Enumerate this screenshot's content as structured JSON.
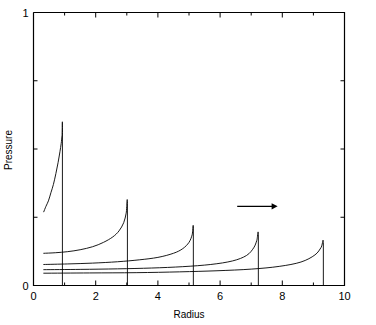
{
  "figure": {
    "background_color": "#ffffff",
    "line_color": "#000000"
  },
  "chart_data": {
    "type": "line",
    "title": "",
    "subtitle": "",
    "xlabel": "Radius",
    "ylabel": "Pressure",
    "xlim": [
      0,
      10
    ],
    "ylim": [
      0,
      1
    ],
    "grid": false,
    "legend": null,
    "x_ticks_major": [
      0,
      2,
      4,
      6,
      8,
      10
    ],
    "x_ticklabels": [
      "0",
      "2",
      "4",
      "6",
      "8",
      "10"
    ],
    "x_ticks_minor": [
      1,
      3,
      5,
      7,
      9
    ],
    "y_ticks_major": [
      0,
      1
    ],
    "y_ticklabels": [
      "0",
      "1"
    ],
    "y_ticks_minor": [
      0.25,
      0.5,
      0.75
    ],
    "series": [
      {
        "name": "profile-1",
        "shock_radius": 0.93,
        "peak_pressure": 0.56,
        "tail_start_x": 0.33,
        "tail_start_y": 0.27,
        "post_shock_y": 0.0,
        "x": [
          0.33,
          0.4,
          0.48,
          0.56,
          0.64,
          0.72,
          0.79,
          0.85,
          0.89,
          0.92,
          0.93,
          0.93
        ],
        "y": [
          0.27,
          0.29,
          0.31,
          0.34,
          0.37,
          0.41,
          0.45,
          0.49,
          0.52,
          0.55,
          0.56,
          0.0
        ]
      },
      {
        "name": "profile-2",
        "shock_radius": 3.02,
        "peak_pressure": 0.3,
        "tail_start_x": 0.33,
        "tail_start_y": 0.118,
        "post_shock_y": 0.0,
        "x": [
          0.33,
          0.7,
          1.1,
          1.5,
          1.9,
          2.25,
          2.55,
          2.75,
          2.9,
          2.98,
          3.02,
          3.02
        ],
        "y": [
          0.118,
          0.12,
          0.124,
          0.131,
          0.142,
          0.158,
          0.178,
          0.2,
          0.23,
          0.265,
          0.3,
          0.0
        ]
      },
      {
        "name": "profile-3",
        "shock_radius": 5.14,
        "peak_pressure": 0.21,
        "tail_start_x": 0.33,
        "tail_start_y": 0.077,
        "post_shock_y": 0.0,
        "x": [
          0.33,
          1.1,
          1.9,
          2.7,
          3.4,
          4.0,
          4.5,
          4.8,
          5.0,
          5.1,
          5.14,
          5.14
        ],
        "y": [
          0.077,
          0.079,
          0.082,
          0.087,
          0.094,
          0.103,
          0.118,
          0.135,
          0.158,
          0.185,
          0.21,
          0.0
        ]
      },
      {
        "name": "profile-4",
        "shock_radius": 7.23,
        "peak_pressure": 0.187,
        "tail_start_x": 0.33,
        "tail_start_y": 0.058,
        "post_shock_y": 0.0,
        "x": [
          0.33,
          1.5,
          2.7,
          3.8,
          4.8,
          5.7,
          6.4,
          6.85,
          7.08,
          7.18,
          7.23,
          7.23
        ],
        "y": [
          0.058,
          0.059,
          0.061,
          0.064,
          0.069,
          0.077,
          0.09,
          0.11,
          0.138,
          0.165,
          0.187,
          0.0
        ]
      },
      {
        "name": "profile-5",
        "shock_radius": 9.32,
        "peak_pressure": 0.158,
        "tail_start_x": 0.33,
        "tail_start_y": 0.045,
        "post_shock_y": 0.0,
        "x": [
          0.33,
          1.8,
          3.3,
          4.7,
          5.9,
          7.0,
          7.9,
          8.6,
          9.05,
          9.25,
          9.32,
          9.32
        ],
        "y": [
          0.045,
          0.046,
          0.047,
          0.05,
          0.054,
          0.06,
          0.07,
          0.086,
          0.112,
          0.14,
          0.158,
          0.0
        ]
      }
    ],
    "annotations": [
      {
        "name": "direction-arrow",
        "kind": "arrow",
        "label": "",
        "x_start": 6.55,
        "x_end": 7.85,
        "y": 0.29,
        "direction": "right"
      }
    ]
  }
}
